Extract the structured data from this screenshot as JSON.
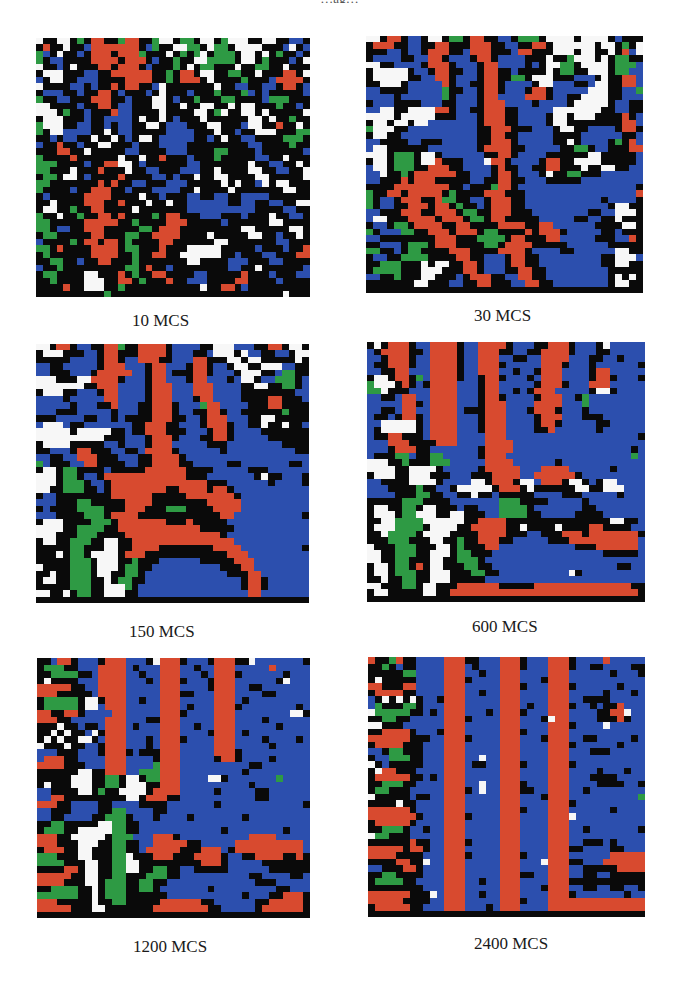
{
  "figure": {
    "top_caption": "…ag…"
  },
  "chart_data": {
    "type": "heatmap",
    "title": "",
    "legend": [],
    "grid_size": [
      40,
      40
    ],
    "palette": {
      "W": "#f7f7f7",
      "K": "#0a0a0a",
      "R": "#d84a2f",
      "B": "#2c4fae",
      "G": "#2e9a44"
    },
    "panels": [
      {
        "label": "10 MCS",
        "rows": [
          "WKKWWKGKRRKKGRRKKGWWKGGKWWKGWWWKKWWKKBBK",
          "KRKKWKKBRRRRRRRKBGKKWWGGKWGGKWWWWKKKBWKB",
          "GBKWKKBKRRRKRRRGKKKWKGKGWKGGGKWWKWKGKKBK",
          "GKBBKKKKRRRRKRRRKBKKGKKWWGGGGKWWKGKKKBKW",
          "WKKBKWKKKRRKRRRKBKKKGKWKGGKKKWKKGGKKWKKK",
          "KWWWKKKBBKKRRRRRRKKGKRRKWWKKGGKKWKKKRRKW",
          "BKWWKKBBBKKKKRRRRKKGKRRRKWKKKKGKKKBRRRRK",
          "WKKKKBBKBKKRKRRKKBWKKKKKKKWKKBBKKBBKRRKB",
          "KBBBKKBKKRRKBKKKBKWKKKBKKKGKKKGBKBKKKKKB",
          "GKKBBKKKRRRKKBKKKWWKBKKGKKKGGKKKKBGGGKKK",
          "WWKKKKBKKRRKBBKKKWWKKWKKWWKKWKWWKKKGKKBK",
          "WWWKGKKBKKKRBBKKKKWKKKKWWKGWKKWWKWKKKKKW",
          "KWWWKKKBKKBBBBKWKKWKBKKKWKKKKKKWWKWKKGKK",
          "GWWWKKBBKKBKBBKKWWKBBBKKKWWKKKBWWKKRKKWK",
          "GKWWBBBBKKWKBBKKKKKBBBBKKKWKKBKKWWWKKKGG",
          "KKBKBBKKWKKWKBKWWKBBBBBKKBKWKKBBKKKKGGGK",
          "BKKRKKBKKWWKKKBKKKBBBBKKKKKKKKKBBKKKKGKK",
          "KKKRRKKWKKKKKBBKKKKBBBKKKKGGKKKKBKKKKKKB",
          "GKKKKRKKKKKKWKKWKKRKKKBKKKGKKKKKBBKKWKKK",
          "GGGKKKKBKKRRWWKBKKKKKKBBKKKKKKKWKKBBKKWK",
          "GGKKKWKKKRKKKWKKBBKKKBBBKKWKKKKWWKKBBKKW",
          "KGGKWWKBKKKKRKKKKBBKBKKWKKWWKKKKWWKKKKKW",
          "GGKKKKKKKRKRKKBBKKKBBBKKKKKWKWKKBWKWWKKK",
          "GKKKKBKKRRRKKBKKKBBBBKKWKKKKWKKKKKKKWWKK",
          "KBKKKKKRRRRKKKKWKKBKKKBBKKBBKKBBBBKKKKKK",
          "KKWKKKKRRRKKRKKKWKKWKKBBBBBBKKBBKKBBKKWW",
          "KWWKKGKKRRKKKKWKKKKKKKBBBBBBBBBBKKKKBBKK",
          "GKKWKKGKKRRKRKKKKGKRRKKKBBBKKKBKKKWKKBBK",
          "GGKKKKKRRRRRKKGKKKKRRRKKKKKBKKKKKKWWKKKK",
          "GGKBBKKRRRKKKKKGGKRRRKKKKKKKKKWWKKKKKWWK",
          "KGGKKKKKRRKKKGGKKRRRRKKKKWKKKKKWWKKBKKWK",
          "BKKKKGKRRKRRKGKKKKRRKKKKKKWWKKKKKKKBBKKK",
          "GGKRKKKKRRRRKGGKKKRKKKWWWWWKKKKKBKKKBKKR",
          "KGKKKKKKRRRRKKGKKRRKKWWWWWWKKBKKKBBKKKRR",
          "KKGGKKBKKRRKKKGKKKKKKKWWKKKKBBBKKKBBKKKK",
          "BKKGKKKKKKKKKGGKRKKBKKKKKKKKBBKKWKKKKKKB",
          "KGGKKKKWWKKKRKGKKRRKKKKBBKKKKKRKKKBKKKBB",
          "KKGKKKKWWWKKRRKGKKKRKKBBBKKKKRRKKKKBKKKK",
          "KKKKRKKWWWKKGKKKKKKKKKKKWKKRRKBKKKKKKKKK",
          "KKKKKKKKKKGKKKKKKKKKKKKKKKKKKKKKKKKKWKKK"
        ]
      },
      {
        "label": "30 MCS",
        "rows": [
          "WWKRRKBBKWWKGGKRRKKBBKGGGKWWWWKWWWWKBKKK",
          "KRRRKKBBKKRRKKKRRRKKBBKKRRKWWWWWWKWWKGKW",
          "KKKBBKBBKRRRKKBRRRKKKBRRKKKWWWKWWKKWKRBW",
          "KBBBBKKBBRRKBBBKRRKBBBBKKKWKKGWWWKWKGGKK",
          "WWKKBBBBKRRRKBBBKRRBBBBKBKWWGGKWWWWKGGGB",
          "KWWWWWKBBKRRKKBBKRRKKBKKKKWKGGKKWWWKGGBB",
          "KWWWWWKKBBRRKBBBKRRKKGGKWWWKKKBBBKWKKRRB",
          "KKWWWKBBBBBRKBBKKRRKBBBBKWWBBBKKBWWKKRRB",
          "BBKKKKBBBBBGKKBBKRRKBBBKRRKBBBBBWWWKKBBG",
          "BBBBKBBBBBBGKBBBKRRBBBBRRRKBBKKWWWWKKBBB",
          "KBBBKKKKBBBKKBBBKRRRBBBBKBBBBKWWWWWKBBKK",
          "BBWWKKWWWWRRKBBKKRRRKKBBBBBWWWWWWWKKBBKK",
          "WWWWKWWWWWKKKBBBKRRRKKBBBBKWWKWWWKKKKRKB",
          "KWWKWWKWWBBBBBBBKRRRKKBBBBKWWKKKKKKKKRRB",
          "GWWWKKBBBBBBBBBBKKRRRKKKBBBKWWKKBBBBKRRK",
          "KWWKKBBBBBBBBBBBKKRRKKBBBBBKKKKBBBBBBKKB",
          "BBKKKKBBKKKBBBBBKKRRRKBBBBBKKWKBBBBKGKRB",
          "BWWKKKKKKBBBBBBBKRRRRKKBBBBBKKGGKBBKKKRR",
          "WWWKGGGKWWKBBBBBBKKRRKBBBBKKKKKKWWKKKKKB",
          "KWWKGGGKWWRKKKBBBWRRKBBBBKRRKKWWWWKKKKKB",
          "BWWKGGGKKRRRKKBBBBKRKKBBKKRRKKKWKKWWKKBB",
          "BBWKKGKRRRRRRKKBBBKRRKBBBKWKKGGKKKBBBBBB",
          "BBKKKRKRRRKKKKKBBKKRRKKBBBKKKKKBBBBBBBBB",
          "KKKKRRRRRRRRKKBKKKGRRKBBBBBBBBBBBBBBBBBK",
          "GKKRRKRRRRRKGKKKKRRRKKKBBBBBBBBBBBBBBBBR",
          "GKBBKRRRKKRGGKKBBKRRRKKBBBBBBBBBBBKBBBBK",
          "GKBBKKRRRKRRKGKKBKRRRKKBBBBBBBBBBBBKWWKK",
          "BBKKKRRRKKRRRKGGKKRRRKKKBBBBBBBBKKBBWWWK",
          "BWWKKKRRRRKRRRKGGKRRKKKKKBBBBBKKBBKKWKKK",
          "KBBKGGKRRRRKKRRKKKKRRRRKKRRBBBBBBKKKKWWK",
          "GKBBBGGKKRRRKRRRKGGKKKKRKRRRKBBBBBKKBKKK",
          "BBKKKKKKKKRRRKKKGGGGKRRKKKRRBBBBBKKKBBRK",
          "KKBBBKGGGKRRRKKKKGGKRRRRKKKKKBBBBBBKKKKK",
          "GGKKBKGGKKKKRRRKKKKRRRRKBBBBKKBBBBBBWWKK",
          "KBBKKGGGGKKKKRRKKBBBKRRKKBBBBBBBBBKKWWWB",
          "KKGGGKKKWKWWKKRRKBBBKRRKKBBBBBBBBBKKWWKK",
          "KGGGGKKKWWWKKKRRKBBBKKRRKKBBBBBBBBBKKKKK",
          "BBKKGKKKWWKKKBKRRRKKBBRRKKBBBBBBBBBKWKWK",
          "KKKKKKKWWKKKBBKKRRKKKBBRRKKBBBBBBBBKWWKK",
          "KKKKKKKKKKKKKKKKKKKKKKKKKKKKKKKKKKKKKKKK"
        ]
      },
      {
        "label": "150 MCS",
        "rows": [
          "WWKRRKBBKKRRGKKRRRRKBBBBKKWWWBBBKKRRKWWK",
          "KWWWKKKBBKRRKKKRRRRKBBBKKBWWWKWBBKKBBKWW",
          "KKKKKBBBBKRRKBBRRRKKBBBRRKKKWWKWWKKKKKWK",
          "BBKKBBBBBKRRRBBBKRRBBBKRRKBBKWWKKWWWBBKK",
          "BBKKKBBBKRRRRRBBKRRBKKKRRKBBBKWWWKKBGGKK",
          "WWWKKKWWRRRRKBBBKRRBBBKRRBBBKBWWKBBGGGKB",
          "WWWWWWWKKRRRBBBBKRRRBBBRRRBBBBKKWWKKGGKB",
          "KWWWKKBBBKRRBBBBKRRRBBBRRRBBBBKKKKKKKKBB",
          "BBBBKBBBBBRRBBBBKRRRBBBKRRBBBBKKKKRRKKKB",
          "BBBBBKBBBKKRBBBKKRRRKBBBGRRBBBBKKKRRKKKK",
          "BBBKKKBBBBBKBBBKKRRRKBBKKRRKBBKKKKKKGKKK",
          "KKKBBBBKKBBKBKKKKRRRKKBBKRRRBBBKKWWKKKKK",
          "BWWWBKKBBBBBBBKKRRRKKBBBKRRRKBBKKWKKWKKB",
          "WWWWWKWWWWWKKBKKRRRKKKBBBKRRKBBBBKKKKKKK",
          "WWWWWWWWWWKKKBBBKRRRKBBBKKRRKBBBBBKKKKKK",
          "KWWWWKKKKKBBKBBBKRRRBBBBBKKKBBBBBBBBKKKK",
          "KKBBBKRRKKKBBKKBRRRRKBBBBBBKBBBBBBBBBBKK",
          "BBKKBBRRRKKKBBBKKRRRRKBBBBBBBBBBBBBBBBBB",
          "GBKKKBBRRKKKKBBKKRRRRKKBBBBBKKBBBBBBBKKB",
          "KWWKGGKKKKBKKKKKRRRRRRKKKKBBBBBKKKBBBBBB",
          "WWWKGGKBBKRRRRRRRRRRRRKKKBBBBBBBKWKKBBBK",
          "WWWKGGGKBBKRRRRRRRRRRRRRRKKKBBBBBBKBBBBK",
          "WWKKGGGKKBKRRRRRRRRKKRRRRKRRKBBBBBBBBBBB",
          "KBBKKKKKKKKRRRRRRKKKKKRRRRRRRKBBBBBBBBBB",
          "BBBKKKGGKKKKKRRRRKKKKKKKKRRRRRBBBBBBBBBB",
          "KBKKKKGGGGKKKRRRKKKGGGKKKKRRRRBBBBBBBBBB",
          "BBBKKKKGGGKRRRRKKKKKKKKKKKKRRBBBBBBBBBBK",
          "KWWWKKKKGGGKRRRRRRRKKKRKKKKKBBBBBBBBBBBB",
          "WWWWKKGGGGKKRRRRRRRRRRRRKKKKKBBBBBBBBBBB",
          "WWWKKKGGGKKKKRRRRRRRRRRRRRRKBBBBBBBBBBBB",
          "KWWKKGGGKKWWKKRRRRRRRRRRRRRRRBBBBBBBBBBB",
          "KKKKKGGKKKWWKKRRRRKKKKKKKKRRRRBBBBBBBBBK",
          "KKKWKGGKWWWWKRRRKKKKKKKKKKKKRRRBBBBBBBBB",
          "KKKKKGGGKWWWKKGKKKBBBBBBKKKKKRRRBBBBBBBB",
          "WKKKKGGGKWWWKGGKKBBBBBBBBBBKKKRRBBBBBBBB",
          "KKWKKGGGKWWKKGGKBBBBBBBBBBBBKKKRRBBBBBBB",
          "KWWKKGGGKKWKGGKKBBBBBBBBBBBBBBKRRKBBBBBB",
          "KKKKKGGGKKWWWGKBBBBBBBBBBBBBBBKRRKBBBBBB",
          "WWKKWKGGKKWWWKKBBBBBBBBBBBBBBBBRRBBBBBBB",
          "KKKKKKKKKKKKKKKKKKKKKKKKKKKKKKKKKKKKKKKK"
        ]
      },
      {
        "label": "600 MCS",
        "rows": [
          "KWKRRRKBBRRRRKBBRRRRKBBBKKRRRKBBBKWBBBBB",
          "BKRRRRKKBRRRRKBBRRRKKBBKKRRRRKBBBKKBBBBB",
          "BBKRRRKBBRRRRKBBRRRBBKKBBRRRRBBBKKBBKBBB",
          "BKKRRRKBBRRRRKBBRRRKBBBBBRRRKBBBKBBBBBBK",
          "BBKKRRBBBRRRRKBBRRRBBKBBKRRRBBBBKRRBBBBB",
          "KWWKRRKGBRRRRKBBKRRKBBBKBRRRBBBBKRRKBBBK",
          "GWWWKRKBKRRRRBBBKRRBBBBBKRRRKBBBRRRBBBBB",
          "GGWKKKBBBRRRRBBBKRRBBKBKRRRBBBBBKWWKBBBB",
          "BBKKBRRBBRRRRBBBKRRKBBBBKRRRBBKGBBBBBBBB",
          "BBBBBRRKBRRRRBBBKRRRBBBBRRRRBBBGBBBBBBBB",
          "BBKKBRRBBRRRRBKKKRRRBBBKRRRKBBBKBBBBBBBB",
          "BKKBKRRKBRRRRBBBKRRRBBBBKRRRBBBKKKBBBBBB",
          "BBWWWWWKBRRRRBBBKRRRBBBBKRRKBBBBBKKBBBBB",
          "BKWWWWWKBRRRRBBBKRRRBBBBKKRBBBBBBKBBBBBB",
          "BKKRRKKKBRRRRBBBBRRRBBBBBBBBBBBBBBBBBBBK",
          "BBBRRRKKKKRRRBBBBRRRRBBBBBBBBBBBBBBBBBBB",
          "BBBKRRRKKBBBBBBBKRRRRBBBBBBBBBBBBBBBBBKB",
          "BKKKGGBKKGGBBBBBKRRRBBBBBBBBBBBBBBBBBBGB",
          "WWWKKGKKKGGGBBBBBRRRRBBBBBBKBBBBBBBBBBBB",
          "WWWWKKWWWWKBBBBBKRRRRRBBBRRRRBBBBBBKBBBB",
          "KWWWKKWWWKKKBBBKKKRRRRBBRRRRRRKBBBBBBBBB",
          "BBKKKKWWWWKBBBBWWKRRRKWWBRRRKWWKBKWWBBBB",
          "BBBKKKKGKKBBKWWWWWKRRRKWKKKKKKWWKKWWWBBB",
          "BBBBKKKGGKKBBKKWKKBKKKKKBBBBKKKBBBBBKBBB",
          "KKKKKGGGKKKKBBBBBBBGGGKKKKBBBBBKBBBBBBBB",
          "KWWKKGGKWWKKKBKKBBBGGGGKBBBBBBBKKBBBBBBB",
          "KWWWKGGWWWKKWWKKKBBGGGGKKBBBBBKKKKBBBBBB",
          "KKWWGGGGWWWWWWKKRRRRKKKKKKKKKKKKKKKWWKKB",
          "KWWWGGGGKWWWWKKRRRRRKKWKKKKWKKKKRRKKKKBB",
          "KKWGGGGKWWWWKKKKRRRRKKKBBKKKRRRKRRRRRRRK",
          "KKKGGGKKKWWKKGKKRRRKKBBBBBKKKRRRRRRRRRRB",
          "WKKKGGGKKKWWKGKKKRRBBBBBBBBBBBKKKRRRRRRB",
          "WWKKGGGKKWWWKGGKKKBBBBBBBBBBBBBBBBKKKKKB",
          "WWKKGGKKKWWKKGGGKBBBBBBBBBBBBBBBBBBBBBBB",
          "KWWKGGKRKWWKKKGGKKBBBBBBBBBBBBBBBBBBKKBB",
          "KWWKGGGKKWWWKKKGGKKBBBBBBBBBBWKBBBBBBBBB",
          "KKWKKGGKKWWWKKKKKBBBBBBBBBBBBBBBBBBBBBBB",
          "WWKKKGGKWWKKKRRRRRRKKKKKRRRRRRRRRRRRRRKK",
          "KWWKKKKKWWKKRRRRRRRRRRRRRRRRRRRRRRRRRRRK",
          "KKKKKKKKKKKKKKKKKKKKKKKKKKKKKKKKKKKKKKKK"
        ]
      },
      {
        "label": "1200 MCS",
        "rows": [
          "KKBRRKBBBKRRRBBBKWRRRKBBBKRRRKKWBBBBBBBK",
          "KGGGKKBBBRRRRBKBBBRRRBBKBBRRRBBBBBRBBBBB",
          "KKGGGGKKBRRRRBBKBBRRRBBBKBRRRKBBBBBBKBBB",
          "KWKKKKBBBRRRRBBBKBRRRKBBBKRRRBBBBBBKWBBB",
          "RRRRRKKBBRRRRBBBBBRRRBBBBKRRRBBKKBBBBBBB",
          "RRRKKKKKBRRRRBBBBBRRRKKBBBRRRBBBBKKBBBBB",
          "KGGGGGKWWKRRRBBKBBRRRBBBBBRRRBKBBBBBBBBB",
          "KGGGGGKWWBRRRBBBBBRRRBKBBBRRRKBBBBBBBBKB",
          "RRKKRRKBBBBRRBBBBBRRRKBBBBRRRBBBBBBBBWWK",
          "RRRKKBBBBBRRRBBBKKRRRBBBBBRRRBBBBKBBBBBB",
          "KKKWKKBKKBRRRBKBBBRRRBBKBBRRRBBBBBBKBBBB",
          "KKWKWKKBWKRRRBBBBBRRRBBBBKRRRBKBBBBBBBBB",
          "KWKWKKWWKBRRRBBBKBRRRKBBBBRRRBBBBKBBBBKB",
          "WKKKWKKBBKRRRBBBKBRRRBBBBBRRRBBBBBKBBBBB",
          "BBBKKKBBBKRRRKBKKKRRRBBBBBRRRKBBBBBBBBBB",
          "BRRRKKBBBBRRRBBBBKRRRBBBBBKRRKBBBBKBBBBB",
          "RRRRKKKBBBRRRBBBBGRRRBBBBBBBBBBKKBBBBBBB",
          "KKKKKKWWKKRRRBBGGGRRRBBBBBBBBBKBBBBBBBBB",
          "KKKKKWWWKKGGKWWKGGRRRBBBBWWKBBBBBBBGBBBB",
          "KWKKKWWWKKGGKWWWKKRRRBBBBBBBBBBKBBBBBBBB",
          "BBKKKKWWKGKKWWWWKRRRRBBBBBKBBBBBKKBBBBBB",
          "BBRRKKKKKKKKKWWKRRRKKBBBBBBBBBBBKKBBBBBB",
          "RRRKKBBBBKKBBBBKKKKBBBBBBBKBBBBBBBBBBBBK",
          "BBKKKBBBBKKGGBBBBKKBBBBBBBBBBBBBBBBBBBBB",
          "BBKKBBBBKKGGGKBBBKBBBBKBBBBBBBKBBBBBBBBB",
          "KKGGKKKKKWWGGKKBBBBBBBBBBBBBBBBBBBBBBBBB",
          "KGGGKKWWWWWGGKKBBBBBBBBBBBBKBBBBBBBBKBBB",
          "RRRKKWWWWWKGGGBBBRRRKBBBBBBBBBBRRRRBBBBB",
          "RRRKKKWWWKKGGKKBBRRRRRKKBBBBBRRRRRRRRRRB",
          "KRRRKKWWKKKGGKKBRRRRRKKKRRRBKRRRRRRRRRRB",
          "GGGKKKWWKKKGGWKKKRRRKKKRRRRKBBKKRRRRKKRK",
          "GGGGKKKWWKKGGWWKKKKKKKKKRRRKBBBBBKKKKKKK",
          "KKKKRRKWWKKGGWWKKGGKKBBKKKKKBBBBBBKKKKKK",
          "RRRRRKKWWKKGGKKKGGGKKBBBBBBBBBBKKBBBBKKB",
          "RRRRKKKWWKGGGKKGGKKBBBBBBBBBBBBBKKKBBBBB",
          "KKGGGGKKWKGGGKKGGKBBBBBBBKBBBBBBBBBKKBBB",
          "GGGGGGKKWKGGGKKKKKKBBBBBBBBBBBKBBBKKRRRK",
          "RRRKKKKKWKKGGKKKKKRRRRRRKKBBBBBBKKRRRRRK",
          "RRRRRKKKWWKKKKKKKRRRRRRRRKKBBBBBKRRRRRRK",
          "KKKKKKKKKKKKKKKKKKKKKKKKKKKKKKKKKKKKKKKK"
        ]
      },
      {
        "label": "2400 MCS",
        "rows": [
          "RKKGRKKBBBBRRRKKBBBRRRKBBBRRRKBBBBRBBBBB",
          "KKGKBKKBBBBRRRBKBBBRRRKBBBRRRKBBKKBBBBKK",
          "KKKKKGGBBBBRRRBBKBBRRRBBBBRRRBBBBBBKBBBK",
          "KWKKKKKBBBBRRRKBBBBRRRBBBKRRRBBBBBBBBBBB",
          "RRKKKRRBBBBRRRBBBBBRRRKBBBRRRKBBBBBBKBBB",
          "KRRRRKKBBBBRRRBBKBBRRRBBBBRRRBBBBBKBBBKB",
          "BKWKWKWKBBKRRRBBBBBRRRBBBBRRRBBKKKKBBBBB",
          "BGKKKGGKBBBRRRBBBBBRRRBKBBRRRKBBKBKKRBBB",
          "WGGGGGKKBKBRRRBBBKBRRRKBBBRRRBBBBKKRRWBB",
          "KKGGKKBBBBBRRRKBBBBRRRBBBKWRRBBBBKKKRKBB",
          "WWKKKBBBBBBRRRBBBBBRRRBBBBRRRKBBBBWBBBBB",
          "KKRRRRKBBBKRRRBBBBBRRRKBBBRRRBBBBBBBBBBB",
          "RRRRRRKKKBBRRRKBBBBRRRBBBKRRRBBKKBBBBBKB",
          "KRRRRKKKBBBRRRBBBBBRRRBBBBRRRKBBBBBBKBBB",
          "BBKGGKKKBBBRRRBBBBBRRRBBBBRRRBBBKKKBBBBB",
          "KBBGGGKKBBBRRRBBWBBRRRBBBBRRRBBBBBBBBBBB",
          "WKBKKKKKBBBRRRBKKBBRRRKBBBRRRKBBBBBBBBBB",
          "KWRRKKKBBBBRRRBBBBBRRRBBBBRRRBBBBKBBBKBB",
          "KRRRRRKKBKBRRRBBBBBRRRBBBBRRRBBBKKKKBBBB",
          "KKGGGKKBBBBRRRBBWBBRRRKBBBRRRBBBBKKKKBBK",
          "KGGKKKBBBBBRRRKBWBBRRRKKBBRRRBBKBBBBBBBB",
          "WKKKKKBKKBBRRRBBBBBRRRBBBKRRRBBBBBBBBBBG",
          "KKKKWKKBBBBRRRBBBBBRRRBBBBRRRKBBBBBBBBBB",
          "RRRRRRKBBBBRRRBBBBBRRRKBBBRRRBBBBBBKBBBB",
          "RRRRRRRKBBBRRRKBBBBRRRBBBBRRRWBBBBBBBBBB",
          "KRRRRRKBBBBRRRBBBBBRRRBBBBRRRBBBBBBBBBBB",
          "KKGGGKBBKBBRRRBBBBBRRRBBBBRRRBBKBBBBBBBK",
          "WGGKKKBBBBBRRRBBBBBRRRBBBBRRRBBBBBBBBBBB",
          "KKKKKKRKKBBRRRKBBBBRRRBBBBRRRBBKKKBKBBBB",
          "RRRRRKRRKBBRRRBBBBBRRRBBBBRRRKKBBBBKKBBB",
          "RRRRKKKKBBBRRRKBBBBRRRKBBBRRRBBBBBBRRRRR",
          "KKKKRRKKWBBRRRBBBBBRRRBBBWRRRKKBBBRRRRRR",
          "BBKKKRRKBBBRRRBBBBBRRRBBBBRRRBBKKKKKRRRR",
          "KKGGKKKKBBBRRRBBBBBRRRKKBBRRRBBKKBBKKKKK",
          "KGGGGKKBBBBRRRBBKBBRRRBBBBRRRKKKKKKKKKKK",
          "KKKKKKKKBBBRRRBBBBBRRRBBBKRRRBBKKBBKKBBK",
          "RRRRRRKKKWBRRRBBKBBRRRBBBBRRRKBBBBBBBKBB",
          "RRRRRKKKKBBRRRBBBBBRRRKBBBRRRRRRRRRRRRRR",
          "KRRRRRKKBBBRRRBBBKBRRRBBBBRRRRRRRRRRRRRR",
          "KKKKKKKKKKKKKKKKKKKKKKKKKKKKKKKKKKKKKKKK"
        ]
      }
    ]
  }
}
